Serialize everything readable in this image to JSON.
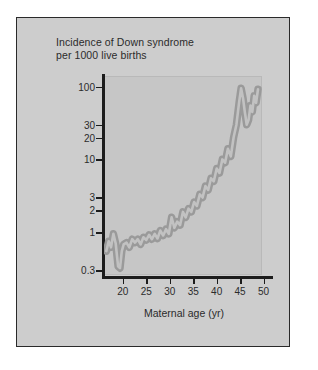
{
  "figure": {
    "title_lines": [
      "Incidence of Down syndrome",
      "per 1000 live births"
    ],
    "background_color": "#cdcdcd",
    "panel_color": "#c6c6c6",
    "frame_color": "#2a2a2a",
    "band_color": "#9a9a9a",
    "inner_line_color": "#c2c2c2"
  },
  "chart_data": {
    "type": "line",
    "title": "Incidence of Down syndrome per 1000 live births",
    "xlabel": "Maternal age (yr)",
    "ylabel": "Incidence of Down syndrome per 1000 live births",
    "yscale": "log",
    "xlim": [
      16,
      52
    ],
    "ylim": [
      0.25,
      140
    ],
    "xticks": [
      20,
      25,
      30,
      35,
      40,
      45,
      50
    ],
    "xtick_labels": [
      "20",
      "25",
      "30",
      "35",
      "40",
      "45",
      "50"
    ],
    "yticks": [
      0.3,
      1,
      2,
      3,
      10,
      20,
      30,
      100
    ],
    "ytick_labels": [
      "0.3",
      "1",
      "2",
      "3",
      "10",
      "20",
      "30",
      "100"
    ],
    "grid": false,
    "legend": null,
    "annotations": [],
    "series": [
      {
        "name": "Incidence per 1000 live births",
        "style": "thick gray band with jagged noisy trace",
        "x": [
          16.5,
          17,
          17.5,
          18,
          18.5,
          19,
          19.4,
          19.8,
          20.2,
          20.8,
          21.4,
          22,
          22.6,
          23.2,
          23.8,
          24.4,
          25,
          25.6,
          26.2,
          26.8,
          27.4,
          28,
          28.6,
          29.2,
          29.8,
          30.4,
          31,
          31.6,
          32.2,
          32.8,
          33.4,
          34,
          34.6,
          35.2,
          35.8,
          36.4,
          37,
          37.6,
          38.2,
          38.8,
          39.4,
          40,
          40.6,
          41.2,
          41.8,
          42.4,
          43,
          43.6,
          44.2,
          44.8,
          45.2,
          45.6,
          46,
          46.4,
          46.8,
          47.2,
          47.6,
          48,
          48.4,
          48.8
        ],
        "y": [
          0.55,
          0.75,
          0.62,
          0.95,
          0.7,
          0.34,
          0.32,
          0.55,
          0.68,
          0.72,
          0.62,
          0.8,
          0.72,
          0.8,
          0.68,
          0.85,
          0.78,
          0.92,
          0.8,
          0.95,
          0.82,
          1.05,
          0.9,
          1.1,
          0.95,
          1.6,
          1.15,
          1.4,
          1.25,
          1.9,
          1.6,
          2.1,
          1.9,
          2.6,
          2.3,
          3.3,
          3.0,
          4.3,
          3.8,
          5.5,
          5.0,
          7.5,
          6.5,
          10.0,
          9.0,
          14.0,
          11.0,
          20.0,
          30.0,
          62.0,
          95.0,
          70.0,
          45.0,
          30.0,
          35.0,
          55.0,
          45.0,
          75.0,
          60.0,
          92.0
        ]
      }
    ]
  }
}
